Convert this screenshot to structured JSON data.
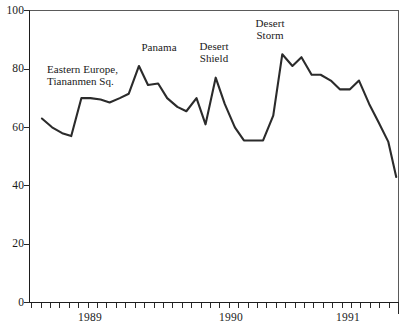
{
  "chart_data": {
    "type": "line",
    "title": "",
    "subtitle": "",
    "xlabel": "",
    "ylabel": "",
    "ylim": [
      0,
      100
    ],
    "yticks": [
      0,
      20,
      40,
      60,
      80,
      100
    ],
    "ytick_labels": [
      "0",
      "20",
      "40",
      "60",
      "80",
      "100"
    ],
    "xtick_labels": [
      "1989",
      "1990",
      "1991"
    ],
    "x_axis_note": "monthly tick marks with longer ticks at year boundaries",
    "grid": false,
    "legend": false,
    "legend_position": "none",
    "line_color": "#2b2b2b",
    "series": [
      {
        "name": "approval",
        "x": [
          0.86,
          0.95,
          1.04,
          1.12,
          1.21,
          1.29,
          1.38,
          1.46,
          1.55,
          1.63,
          1.72,
          1.8,
          1.89,
          1.97,
          2.06,
          2.14,
          2.23,
          2.31,
          2.4,
          2.48,
          2.57,
          2.65,
          2.74,
          2.82,
          2.91,
          2.99,
          3.08,
          3.16,
          3.25,
          3.33,
          3.42,
          3.5,
          3.59,
          3.67,
          3.76,
          3.84,
          3.93,
          4.0
        ],
        "values": [
          63,
          60,
          58,
          57,
          70,
          70,
          69.5,
          68.5,
          70,
          71.5,
          81,
          74.5,
          75,
          70,
          67,
          65.5,
          70,
          61,
          77,
          68,
          60,
          55.5,
          55.5,
          55.5,
          64,
          85,
          81,
          84,
          78,
          78,
          76,
          73,
          73,
          76,
          68,
          62,
          55,
          43
        ]
      }
    ],
    "annotations": [
      {
        "text": "Eastern Europe,\nTiananmen Sq.",
        "x_px": 47,
        "y_px": 63,
        "align": "left"
      },
      {
        "text": "Panama",
        "x_px": 136,
        "y_px": 41,
        "align": "center"
      },
      {
        "text": "Desert\nShield",
        "x_px": 195,
        "y_px": 40,
        "align": "center"
      },
      {
        "text": "Desert\nStorm",
        "x_px": 250,
        "y_px": 17,
        "align": "center"
      }
    ]
  },
  "axes": {
    "y_labels": [
      "100",
      "80",
      "60",
      "40",
      "20",
      "0"
    ],
    "x_labels": [
      "1989",
      "1990",
      "1991"
    ]
  },
  "annotations": {
    "eastern_europe": "Eastern Europe,\nTiananmen Sq.",
    "panama": "Panama",
    "desert_shield": "Desert\nShield",
    "desert_storm": "Desert\nStorm"
  }
}
